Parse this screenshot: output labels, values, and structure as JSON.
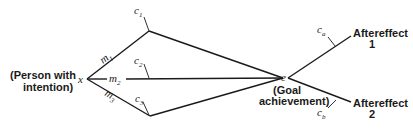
{
  "diagram": {
    "type": "path-diagram",
    "origin": {
      "symbol": "x",
      "label_line1": "(Person with",
      "label_line2": "intention)"
    },
    "goal": {
      "symbol": "e",
      "label_line1": "(Goal",
      "label_line2": "achievement)"
    },
    "means": [
      {
        "symbol": "m",
        "subscript": "1",
        "condition": "c",
        "condition_sub": "1"
      },
      {
        "symbol": "m",
        "subscript": "2",
        "condition": "c",
        "condition_sub": "2"
      },
      {
        "symbol": "m",
        "subscript": "3",
        "condition": "c",
        "condition_sub": "3"
      }
    ],
    "aftereffects": [
      {
        "label_line1": "Aftereffect",
        "label_line2": "1",
        "condition": "c",
        "condition_sub": "a"
      },
      {
        "label_line1": "Aftereffect",
        "label_line2": "2",
        "condition": "c",
        "condition_sub": "b"
      }
    ]
  }
}
